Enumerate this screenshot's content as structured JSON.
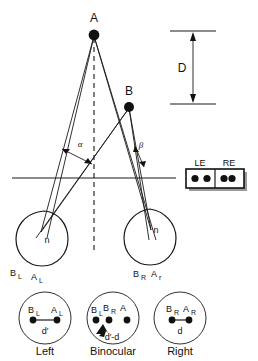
{
  "figure": {
    "stroke_color": "#111111",
    "background_color": "#ffffff"
  },
  "scene": {
    "points": [
      {
        "id": "A",
        "label": "A",
        "x": 94,
        "y": 34,
        "role": "far-fixation-point"
      },
      {
        "id": "B",
        "label": "B",
        "x": 129,
        "y": 106,
        "role": "near-object-point"
      }
    ],
    "depth_measure": {
      "label": "D",
      "top_y": 32,
      "bottom_y": 104,
      "axis_x": 193
    },
    "angles": [
      {
        "id": "alpha",
        "label": "α",
        "x": 80,
        "y": 146
      },
      {
        "id": "beta",
        "label": "β",
        "x": 141,
        "y": 146
      }
    ],
    "baseline": {
      "y": 178,
      "x1": 12,
      "x2": 176
    },
    "midline_label": "vertical-dashed-midline"
  },
  "eyes": [
    {
      "id": "left-eye",
      "nodal_label": "n",
      "image_labels": [
        {
          "text": "B",
          "sub": "L"
        },
        {
          "text": "A",
          "sub": "L"
        }
      ]
    },
    {
      "id": "right-eye",
      "nodal_label": "n",
      "image_labels": [
        {
          "text": "B",
          "sub": "R"
        },
        {
          "text": "A",
          "sub": "r"
        }
      ]
    }
  ],
  "eye_panel": {
    "left_label": "LE",
    "right_label": "RE",
    "left_dots": 2,
    "right_dots": 2,
    "name": "le-re-retinal-image-panel"
  },
  "views": [
    {
      "id": "left-view",
      "caption": "Left",
      "dot_labels": [
        {
          "text": "B",
          "sub": "L"
        },
        {
          "text": "A",
          "sub": "L"
        }
      ],
      "separation_label": "d′",
      "dots": 2
    },
    {
      "id": "binocular-view",
      "caption": "Binocular",
      "dot_labels": [
        {
          "text": "B",
          "sub": "L"
        },
        {
          "text": "B",
          "sub": "R"
        },
        {
          "text": "A",
          "sub": ""
        }
      ],
      "separation_label": "d′-d",
      "dots": 3
    },
    {
      "id": "right-view",
      "caption": "Right",
      "dot_labels": [
        {
          "text": "B",
          "sub": "R"
        },
        {
          "text": "A",
          "sub": "R"
        }
      ],
      "separation_label": "d",
      "dots": 2
    }
  ]
}
